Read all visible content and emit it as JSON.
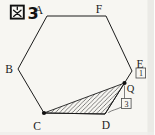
{
  "figure": {
    "kanji": "図",
    "number": "3"
  },
  "labels": {
    "A": "A",
    "B": "B",
    "C": "C",
    "D": "D",
    "E": "E",
    "F": "F",
    "Q": "Q"
  },
  "ratio_boxes": {
    "EQ": "1",
    "QD": "3"
  },
  "colors": {
    "ink": "#1c1c1c",
    "paper": "#f7f6f2",
    "scan_edge": "#e9e8e4",
    "box_stroke": "#4a4a4a"
  },
  "geometry": {
    "points": {
      "A": [
        47,
        16
      ],
      "F": [
        106,
        16
      ],
      "E": [
        132,
        71
      ],
      "Q": [
        124.5,
        83
      ],
      "D": [
        105,
        114
      ],
      "C": [
        44,
        113
      ],
      "B": [
        18,
        69
      ]
    },
    "hexagon_order": [
      "A",
      "F",
      "E",
      "D",
      "C",
      "B"
    ],
    "shaded_triangle": [
      "C",
      "D",
      "Q"
    ],
    "dot_points": [
      "C",
      "Q"
    ],
    "segment_ratio_EQ_to_QD": "1:3"
  }
}
